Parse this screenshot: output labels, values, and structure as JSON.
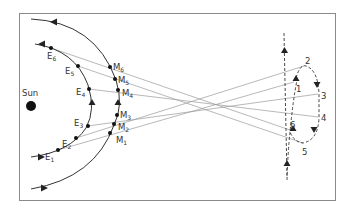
{
  "diagram": {
    "sun": {
      "label": "Sun",
      "x": 31,
      "y": 106
    },
    "earth_positions": [
      {
        "label": "E",
        "index": "1",
        "x": 58,
        "y": 150
      },
      {
        "label": "E",
        "index": "2",
        "x": 76,
        "y": 138
      },
      {
        "label": "E",
        "index": "3",
        "x": 88,
        "y": 126
      },
      {
        "label": "E",
        "index": "4",
        "x": 89,
        "y": 89
      },
      {
        "label": "E",
        "index": "5",
        "x": 78,
        "y": 66
      },
      {
        "label": "E",
        "index": "6",
        "x": 51,
        "y": 48
      }
    ],
    "mars_positions": [
      {
        "label": "M",
        "index": "1",
        "x": 110,
        "y": 133
      },
      {
        "label": "M",
        "index": "2",
        "x": 114,
        "y": 124
      },
      {
        "label": "M",
        "index": "3",
        "x": 117,
        "y": 115
      },
      {
        "label": "M",
        "index": "4",
        "x": 118,
        "y": 90
      },
      {
        "label": "M",
        "index": "5",
        "x": 115,
        "y": 79
      },
      {
        "label": "M",
        "index": "6",
        "x": 110,
        "y": 67
      }
    ],
    "apparent_positions": [
      {
        "label": "1",
        "x": 294,
        "y": 82
      },
      {
        "label": "2",
        "x": 304,
        "y": 66
      },
      {
        "label": "3",
        "x": 318,
        "y": 94
      },
      {
        "label": "4",
        "x": 318,
        "y": 117
      },
      {
        "label": "5",
        "x": 303,
        "y": 143
      },
      {
        "label": "6",
        "x": 290,
        "y": 130
      }
    ],
    "colors": {
      "line": "#333333",
      "sightline": "#999999",
      "border": "#888888"
    }
  }
}
